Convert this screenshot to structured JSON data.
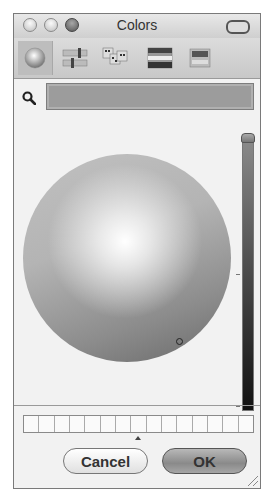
{
  "window": {
    "title": "Colors",
    "controls": [
      "close",
      "minimize",
      "zoom"
    ]
  },
  "toolbar": {
    "tabs": [
      {
        "name": "color-wheel",
        "icon": "color-wheel-icon",
        "selected": true
      },
      {
        "name": "color-sliders",
        "icon": "color-sliders-icon",
        "selected": false
      },
      {
        "name": "color-palettes",
        "icon": "color-palettes-icon",
        "selected": false
      },
      {
        "name": "image-palettes",
        "icon": "image-palettes-icon",
        "selected": false
      },
      {
        "name": "crayons",
        "icon": "crayons-icon",
        "selected": false
      }
    ]
  },
  "search": {
    "value": "",
    "placeholder": ""
  },
  "color_wheel": {
    "cursor": {
      "x": 155,
      "y": 186
    }
  },
  "brightness_slider": {
    "value_percent": 100
  },
  "swatches": {
    "count": 15
  },
  "buttons": {
    "cancel_label": "Cancel",
    "ok_label": "OK"
  }
}
